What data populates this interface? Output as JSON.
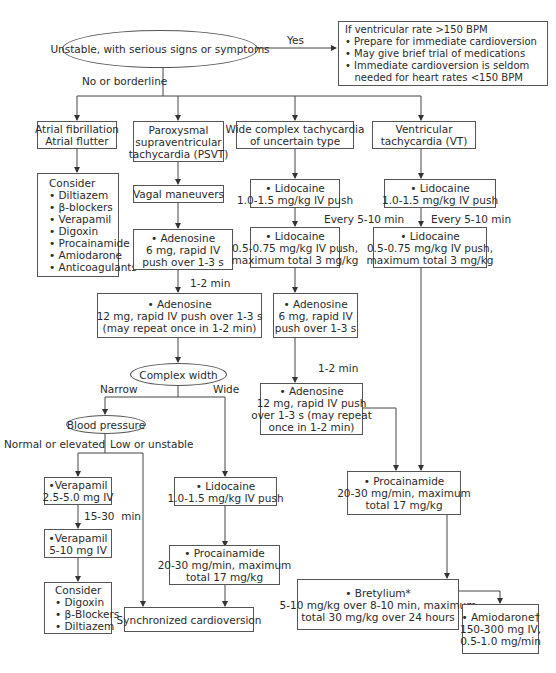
{
  "start": {
    "label": "Unstable, with serious signs or symptoms"
  },
  "edges": {
    "yes": "Yes",
    "no_borderline": "No or borderline",
    "one_two_min_a": "1-2 min",
    "one_two_min_b": "1-2 min",
    "every_5_10_a": "Every 5-10 min",
    "every_5_10_b": "Every 5-10 min",
    "narrow": "Narrow",
    "wide": "Wide",
    "normal_elevated": "Normal or elevated",
    "low_unstable": "Low or unstable",
    "fifteen_thirty": "15-30  min"
  },
  "unstable_box": {
    "lines": [
      "If ventricular rate >150 BPM",
      "• Prepare for immediate cardioversion",
      "• May give brief trial of medications",
      "• Immediate cardioversion is seldom",
      "   needed for heart rates <150 BPM"
    ]
  },
  "afib": {
    "title": [
      "Atrial fibrillation",
      "Atrial flutter"
    ],
    "consider": [
      "Consider",
      "• Diltiazem",
      "• β-blockers",
      "• Verapamil",
      "• Digoxin",
      "• Procainamide",
      "• Amiodarone",
      "• Anticoagulants"
    ]
  },
  "psvt": {
    "title": [
      "Paroxysmal",
      "supraventricular",
      "tachycardia (PSVT)"
    ],
    "vagal": "Vagal maneuvers",
    "adenosine6": [
      "• Adenosine",
      "6 mg, rapid IV",
      "push over 1-3 s"
    ],
    "adenosine12": [
      "• Adenosine",
      "12 mg, rapid IV push over 1-3 s",
      "(may repeat once in 1-2 min)"
    ],
    "complex_width": "Complex width",
    "blood_pressure": "Blood pressure",
    "verapamil1": [
      "•Verapamil",
      "2.5-5.0 mg IV"
    ],
    "verapamil2": [
      "•Verapamil",
      "5-10 mg IV"
    ],
    "consider": [
      "Consider",
      "• Digoxin",
      "• β-Blockers",
      "• Diltiazem"
    ],
    "lidocaine": [
      "• Lidocaine",
      "1.0-1.5 mg/kg IV push"
    ],
    "procainamide": [
      "• Procainamide",
      "20-30 mg/min, maximum",
      "total 17 mg/kg"
    ],
    "cardioversion": "Synchronized cardioversion"
  },
  "wide": {
    "title": [
      "Wide complex tachycardia",
      "of uncertain type"
    ],
    "lidocaine1": [
      "• Lidocaine",
      "1.0-1.5 mg/kg IV push"
    ],
    "lidocaine2": [
      "• Lidocaine",
      "0.5-0.75 mg/kg IV push,",
      "maximum total 3 mg/kg"
    ],
    "adenosine6": [
      "• Adenosine",
      "6 mg, rapid IV",
      "push over 1-3 s"
    ],
    "adenosine12": [
      "• Adenosine",
      "12 mg, rapid IV push",
      "over 1-3 s (may repeat",
      "once in 1-2 min)"
    ]
  },
  "vt": {
    "title": [
      "Ventricular",
      "tachycardia (VT)"
    ],
    "lidocaine1": [
      "• Lidocaine",
      "1.0-1.5 mg/kg IV push"
    ],
    "lidocaine2": [
      "• Lidocaine",
      "0.5-0.75 mg/kg IV push,",
      "maximum total 3 mg/kg"
    ]
  },
  "shared": {
    "procainamide": [
      "• Procainamide",
      "20-30 mg/min, maximum",
      "total 17 mg/kg"
    ],
    "bretylium": [
      "• Bretylium*",
      "5-10 mg/kg over 8-10 min, maximum",
      "total 30 mg/kg over 24 hours"
    ],
    "amiodarone": [
      "• Amiodarone†",
      "150-300 mg IV,",
      "0.5-1.0 mg/min"
    ]
  }
}
